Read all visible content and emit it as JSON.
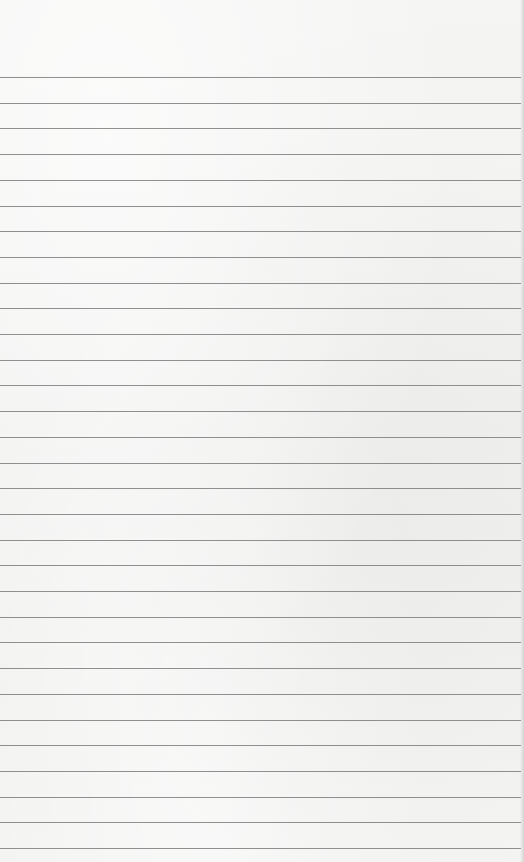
{
  "page": {
    "type": "lined-paper",
    "background_color": "#f3f3f2",
    "rule_color": "#7d7d7d",
    "rule_count": 31,
    "first_rule_y": 77,
    "rule_spacing": 25.7,
    "text_lines": []
  }
}
